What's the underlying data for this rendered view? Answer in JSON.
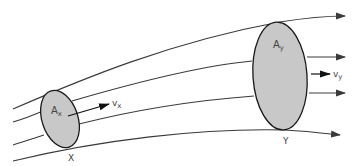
{
  "diagram": {
    "colors": {
      "line": "#3a3a3a",
      "ellipse_fill": "#c8c8c8",
      "ellipse_stroke": "#1a1a1a",
      "text": "#444444"
    },
    "sections": [
      {
        "id": "X",
        "area_label": "A",
        "area_subscript": "x",
        "velocity_label": "v",
        "velocity_subscript": "x",
        "point_label": "X"
      },
      {
        "id": "Y",
        "area_label": "A",
        "area_subscript": "y",
        "velocity_label": "v",
        "velocity_subscript": "y",
        "point_label": "Y"
      }
    ],
    "streamline_count": 4
  }
}
